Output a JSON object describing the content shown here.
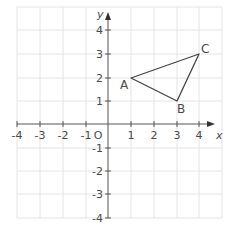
{
  "diagram": {
    "type": "coordinate-grid",
    "axes": {
      "x_label": "x",
      "y_label": "y",
      "origin_label": "O",
      "x_ticks": [
        "-4",
        "-3",
        "-2",
        "-1",
        "1",
        "2",
        "3",
        "4"
      ],
      "y_ticks": [
        "4",
        "3",
        "2",
        "1",
        "-1",
        "-2",
        "-3",
        "-4"
      ],
      "x_range": [
        -4,
        5
      ],
      "y_range": [
        -4,
        5
      ]
    },
    "triangle": {
      "vertices": [
        {
          "label": "A",
          "x": 1,
          "y": 2
        },
        {
          "label": "B",
          "x": 3,
          "y": 1
        },
        {
          "label": "C",
          "x": 4,
          "y": 3
        }
      ]
    },
    "colors": {
      "grid": "#e4e4e4",
      "axis": "#555555",
      "triangle": "#444444",
      "text": "#4a4a4a"
    }
  }
}
